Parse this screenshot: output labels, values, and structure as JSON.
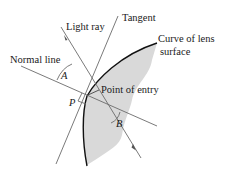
{
  "diagram": {
    "labels": {
      "light_ray": "Light ray",
      "tangent": "Tangent",
      "curve_line1": "Curve of lens",
      "curve_line2": "surface",
      "normal_line": "Normal line",
      "point_of_entry": "Point of entry",
      "angle_a": "A",
      "angle_b": "B",
      "point_p": "P"
    },
    "colors": {
      "lens_fill": "#d9d9d9",
      "lines": "#6b6b6b",
      "curve": "#111111",
      "text": "#1a1a1a"
    }
  }
}
